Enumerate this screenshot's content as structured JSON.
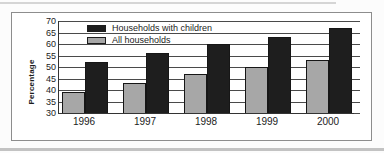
{
  "chart_data": {
    "type": "bar",
    "title": "",
    "ylabel": "Percentage",
    "xlabel": "",
    "categories": [
      "1996",
      "1997",
      "1998",
      "1999",
      "2000"
    ],
    "series": [
      {
        "name": "Households with children",
        "color": "#1e1e1e",
        "values": [
          52,
          56,
          60,
          63,
          67
        ]
      },
      {
        "name": "All households",
        "color": "#a7a7a7",
        "values": [
          39,
          43,
          47,
          50,
          53
        ]
      }
    ],
    "draw_order_left_to_right": [
      "All households",
      "Households with children"
    ],
    "ylim": [
      30,
      70
    ],
    "yticks": [
      30,
      35,
      40,
      45,
      50,
      55,
      60,
      65,
      70
    ],
    "grid": "horizontal",
    "legend_position": "top-left inside plot"
  }
}
